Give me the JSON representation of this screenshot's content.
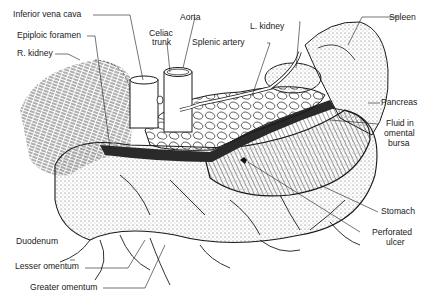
{
  "figure": {
    "colors": {
      "ink": "#1a1a1a",
      "background": "#ffffff",
      "stipple": "#9a9a9a"
    }
  },
  "labels": {
    "inferior_vena_cava": "Inferior vena cava",
    "celiac_trunk_line1": "Celiac",
    "celiac_trunk_line2": "trunk",
    "aorta": "Aorta",
    "l_kidney": "L. kidney",
    "spleen": "Spleen",
    "epiploic_foramen": "Epiploic foramen",
    "r_kidney": "R. kidney",
    "splenic_artery": "Splenic artery",
    "pancreas": "Pancreas",
    "fluid_line1": "Fluid in",
    "fluid_line2": "omental",
    "fluid_line3": "bursa",
    "stomach": "Stomach",
    "perforated_line1": "Perforated",
    "perforated_line2": "ulcer",
    "duodenum": "Duodenum",
    "lesser_omentum": "Lesser omentum",
    "greater_omentum": "Greater omentum"
  }
}
